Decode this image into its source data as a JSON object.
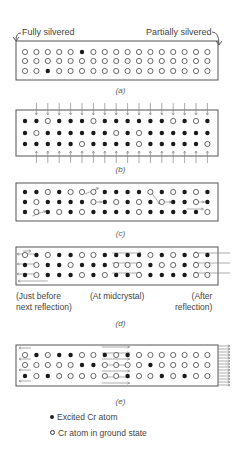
{
  "figure": {
    "labels": {
      "fully_silvered": "Fully silvered",
      "partially_silvered": "Partially silvered"
    },
    "grid": {
      "rows": 3,
      "cols": 17
    },
    "panels": [
      {
        "id": "a",
        "caption": "(a)",
        "box": {
          "x": 16,
          "y": 41,
          "w": 202,
          "h": 39
        },
        "row_y": [
          52,
          61,
          71
        ],
        "filled": [
          [
            5
          ],
          [],
          [
            2
          ]
        ],
        "default": "open",
        "arrows": "none"
      },
      {
        "id": "b",
        "caption": "(b)",
        "box": {
          "x": 16,
          "y": 110,
          "w": 202,
          "h": 46
        },
        "row_y": [
          121,
          133,
          144
        ],
        "open": [
          [
            2,
            6,
            13,
            15
          ],
          [
            1,
            8,
            10
          ],
          [
            5,
            10,
            16
          ]
        ],
        "default": "filled",
        "arrows": "vertical"
      },
      {
        "id": "c",
        "caption": "(c)",
        "box": {
          "x": 16,
          "y": 183,
          "w": 202,
          "h": 38
        },
        "row_y": [
          192,
          202,
          212
        ],
        "open": [
          [
            2,
            4,
            5,
            6,
            11,
            13,
            15
          ],
          [
            1,
            6,
            8,
            10,
            12,
            15
          ],
          [
            1,
            3,
            5,
            10,
            16
          ]
        ],
        "default": "filled",
        "arrows": "spontaneous"
      },
      {
        "id": "d",
        "caption": "(d)",
        "box": {
          "x": 16,
          "y": 247,
          "w": 202,
          "h": 38
        },
        "row_y": [
          255,
          265,
          275
        ],
        "open": [
          [
            0,
            2,
            5,
            6,
            11,
            13,
            15
          ],
          [
            1,
            4,
            8,
            9,
            10,
            12,
            13,
            15,
            16
          ],
          [
            1,
            5,
            7,
            10,
            15,
            16
          ]
        ],
        "default": "filled",
        "arrows": "groups",
        "sublabels": {
          "left": "(Just before\nnext reflection)",
          "middle": "(At midcrystal)",
          "right": "(After\nreflection)"
        }
      },
      {
        "id": "e",
        "caption": "(e)",
        "box": {
          "x": 16,
          "y": 345,
          "w": 202,
          "h": 41
        },
        "row_y": [
          355,
          365,
          376
        ],
        "filled": [
          [
            1,
            3,
            4,
            7,
            9
          ],
          [
            5,
            6,
            11
          ],
          [
            0,
            2,
            9,
            12,
            14
          ]
        ],
        "default": "open",
        "arrows": "output"
      }
    ],
    "legend": {
      "excited": "Excited Cr atom",
      "ground": "Cr atom in ground state"
    },
    "colors": {
      "ink": "#333333",
      "box": "#555555",
      "arrow": "#888888",
      "background": "#ffffff"
    }
  }
}
